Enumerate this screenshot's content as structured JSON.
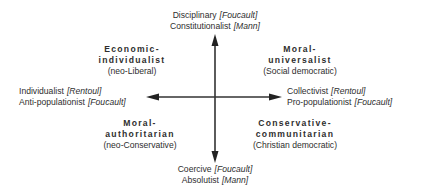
{
  "diagram": {
    "axes": {
      "top": {
        "lines": [
          {
            "term": "Disciplinary",
            "source": "[Foucault]"
          },
          {
            "term": "Constitutionalist",
            "source": "[Mann]"
          }
        ]
      },
      "bottom": {
        "lines": [
          {
            "term": "Coercive",
            "source": "[Foucault]"
          },
          {
            "term": "Absolutist",
            "source": "[Mann]"
          }
        ]
      },
      "left": {
        "lines": [
          {
            "term": "Individualist",
            "source": "[Rentoul]"
          },
          {
            "term": "Anti-populationist",
            "source": "[Foucault]"
          }
        ]
      },
      "right": {
        "lines": [
          {
            "term": "Collectivist",
            "source": "[Rentoul]"
          },
          {
            "term": "Pro-populationist",
            "source": "[Foucault]"
          }
        ]
      }
    },
    "quadrants": {
      "top_left": {
        "title_line1": "Economic-",
        "title_line2": "individualist",
        "subtitle": "(neo-Liberal)"
      },
      "top_right": {
        "title_line1": "Moral-",
        "title_line2": "universalist",
        "subtitle": "(Social democratic)"
      },
      "bottom_left": {
        "title_line1": "Moral-",
        "title_line2": "authoritarian",
        "subtitle": "(neo-Conservative)"
      },
      "bottom_right": {
        "title_line1": "Conservative-",
        "title_line2": "communitarian",
        "subtitle": "(Christian democratic)"
      }
    },
    "colors": {
      "axis": "#333333",
      "text": "#2e2e2e",
      "background": "#ffffff"
    }
  }
}
